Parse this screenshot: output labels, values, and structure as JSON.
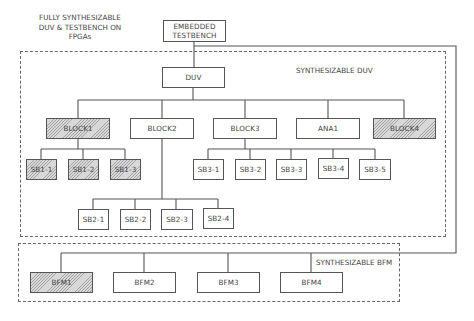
{
  "title": {
    "line1": "FULLY SYNTHESIZABLE",
    "line2": "DUV & TESTBENCH ON",
    "line3": "FPGAs"
  },
  "testbench": {
    "line1": "EMBEDDED",
    "line2": "TESTBENCH"
  },
  "duv_region": {
    "label": "SYNTHESIZABLE DUV"
  },
  "bfm_region": {
    "label": "SYNTHESIZABLE BFM"
  },
  "duv": {
    "label": "DUV"
  },
  "blocks": [
    {
      "label": "BLOCK1",
      "hatched": true
    },
    {
      "label": "BLOCK2",
      "hatched": false
    },
    {
      "label": "BLOCK3",
      "hatched": false
    },
    {
      "label": "ANA1",
      "hatched": false
    },
    {
      "label": "BLOCK4",
      "hatched": true
    }
  ],
  "sb1": [
    {
      "label": "SB1-1",
      "hatched": true
    },
    {
      "label": "SB1-2",
      "hatched": true
    },
    {
      "label": "SB1-3",
      "hatched": true
    }
  ],
  "sb2": [
    {
      "label": "SB2-1"
    },
    {
      "label": "SB2-2"
    },
    {
      "label": "SB2-3"
    },
    {
      "label": "SB2-4"
    }
  ],
  "sb3": [
    {
      "label": "SB3-1"
    },
    {
      "label": "SB3-2"
    },
    {
      "label": "SB3-3"
    },
    {
      "label": "SB3-4"
    },
    {
      "label": "SB3-5"
    }
  ],
  "bfms": [
    {
      "label": "BFM1",
      "hatched": true
    },
    {
      "label": "BFM2",
      "hatched": false
    },
    {
      "label": "BFM3",
      "hatched": false
    },
    {
      "label": "BFM4",
      "hatched": false
    }
  ]
}
